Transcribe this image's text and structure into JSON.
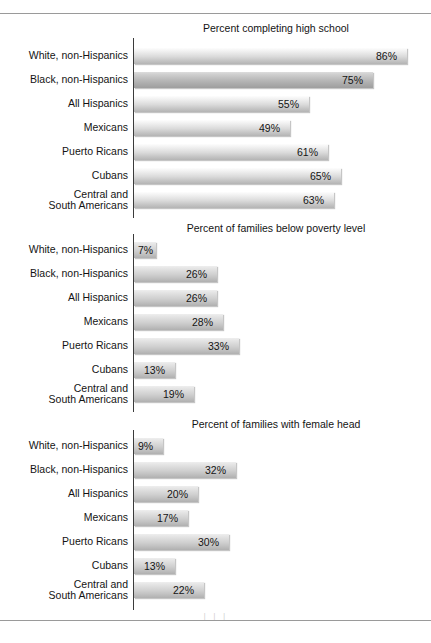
{
  "figure": {
    "rule_top_label": "top-divider",
    "rule_bottom_label": "bottom-divider",
    "footer_mark": "| | |"
  },
  "chart_data": [
    {
      "type": "bar",
      "orientation": "horizontal",
      "title": "Percent completing high school",
      "xlabel": "",
      "ylabel": "",
      "xlim": [
        0,
        100
      ],
      "grid": false,
      "legend": "none",
      "value_suffix": "%",
      "categories": [
        "White, non-Hispanics",
        "Black, non-Hispanics",
        "All Hispanics",
        "Mexicans",
        "Puerto Ricans",
        "Cubans",
        "Central and\nSouth Americans"
      ],
      "values": [
        86,
        75,
        55,
        49,
        61,
        65,
        63
      ],
      "labels": [
        "86%",
        "75%",
        "55%",
        "49%",
        "61%",
        "65%",
        "63%"
      ],
      "highlight_index": 1
    },
    {
      "type": "bar",
      "orientation": "horizontal",
      "title": "Percent of families below poverty level",
      "xlabel": "",
      "ylabel": "",
      "xlim": [
        0,
        100
      ],
      "grid": false,
      "legend": "none",
      "value_suffix": "%",
      "categories": [
        "White, non-Hispanics",
        "Black, non-Hispanics",
        "All Hispanics",
        "Mexicans",
        "Puerto Ricans",
        "Cubans",
        "Central and\nSouth Americans"
      ],
      "values": [
        7,
        26,
        26,
        28,
        33,
        13,
        19
      ],
      "labels": [
        "7%",
        "26%",
        "26%",
        "28%",
        "33%",
        "13%",
        "19%"
      ],
      "highlight_index": -1
    },
    {
      "type": "bar",
      "orientation": "horizontal",
      "title": "Percent of families with female head",
      "xlabel": "",
      "ylabel": "",
      "xlim": [
        0,
        100
      ],
      "grid": false,
      "legend": "none",
      "value_suffix": "%",
      "categories": [
        "White, non-Hispanics",
        "Black, non-Hispanics",
        "All Hispanics",
        "Mexicans",
        "Puerto Ricans",
        "Cubans",
        "Central and\nSouth Americans"
      ],
      "values": [
        9,
        32,
        20,
        17,
        30,
        13,
        22
      ],
      "labels": [
        "9%",
        "32%",
        "20%",
        "17%",
        "30%",
        "13%",
        "22%"
      ],
      "highlight_index": -1
    }
  ],
  "panels": [
    {
      "title": "Percent completing high school",
      "top": 22,
      "axis_top": 38,
      "axis_height": 180
    },
    {
      "title": "Percent of families below poverty level",
      "top": 222,
      "axis_top": 234,
      "axis_height": 178
    },
    {
      "title": "Percent of families with female head",
      "top": 418,
      "axis_top": 430,
      "axis_height": 180
    }
  ],
  "colors": {
    "bar_light_top": "#fdfdfd",
    "bar_light_bottom": "#b4b4b4",
    "bar_accent_bottom": "#9e9e9e",
    "axis": "#3b3b3b",
    "rule": "#9a9a9a",
    "text": "#141414"
  }
}
